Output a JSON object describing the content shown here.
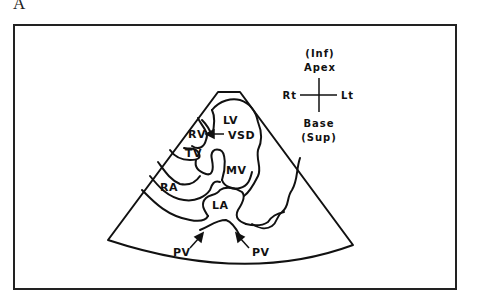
{
  "figure": {
    "panel_label": "A"
  },
  "orientation": {
    "top_paren": "(Inf)",
    "top": "Apex",
    "left": "Rt",
    "right": "Lt",
    "bottom": "Base",
    "bottom_paren": "(Sup)"
  },
  "structures": {
    "lv": "LV",
    "rv": "RV",
    "vsd": "VSD",
    "tv": "TV",
    "mv": "MV",
    "ra": "RA",
    "la": "LA",
    "pv_left": "PV",
    "pv_right": "PV"
  },
  "colors": {
    "ink": "#111111",
    "background": "#ffffff"
  }
}
